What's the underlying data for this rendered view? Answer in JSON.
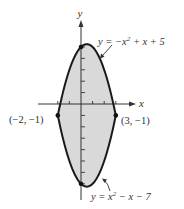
{
  "figure": {
    "type": "region-between-curves",
    "axes": {
      "x_label": "x",
      "y_label": "y",
      "origin_px": [
        81,
        104
      ],
      "scale_px": [
        11.6,
        11.4
      ],
      "x_ticks": [
        -2,
        -1,
        1,
        2,
        3
      ],
      "y_ticks": [
        -7,
        -6,
        -5,
        -4,
        -3,
        -2,
        -1,
        1,
        2,
        3,
        4,
        5
      ]
    },
    "curves": [
      {
        "name": "upper",
        "label": "y = −x² + x + 5",
        "a": -1,
        "b": 1,
        "c": 5
      },
      {
        "name": "lower",
        "label": "y = x² − x − 7",
        "a": 1,
        "b": -1,
        "c": -7
      }
    ],
    "x_range": [
      -2,
      3
    ],
    "intersection_points": [
      {
        "label": "(−2, −1)",
        "x": -2,
        "y": -1
      },
      {
        "label": "(3, −1)",
        "x": 3,
        "y": -1
      }
    ],
    "highlight_points": [
      {
        "x": 0,
        "y": 5
      },
      {
        "x": 0,
        "y": -7
      }
    ],
    "colors": {
      "fill": "#d9d9d9",
      "curve": "#1a1a1a",
      "axis": "#333333",
      "text": "#333333"
    }
  }
}
